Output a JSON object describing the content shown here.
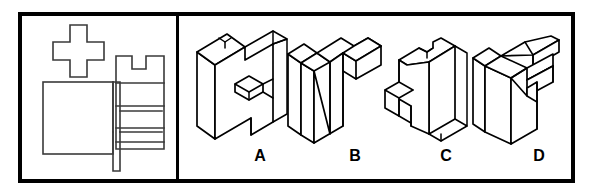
{
  "question": {
    "type": "spatial-visualization-multiple-choice",
    "left_panel": {
      "name": "orthographic-views",
      "description": "Three orthographic projection views of a block: a plus/cross shaped top view, a rectangular front view, and a right side view with a rectangular notch in its top edge and three horizontal division lines."
    },
    "right_panel": {
      "name": "isometric-options",
      "description": "Four isometric pictorial drawings of candidate solid blocks labelled A through D."
    }
  },
  "options": [
    {
      "id": "A",
      "label": "A",
      "name": "option-a"
    },
    {
      "id": "B",
      "label": "B",
      "name": "option-b"
    },
    {
      "id": "C",
      "label": "C",
      "name": "option-c"
    },
    {
      "id": "D",
      "label": "D",
      "name": "option-d"
    }
  ],
  "colors": {
    "border": "#000000",
    "line": "#3a3a3a",
    "iso_stroke": "#000000",
    "background": "#ffffff",
    "label_text": "#000000"
  }
}
